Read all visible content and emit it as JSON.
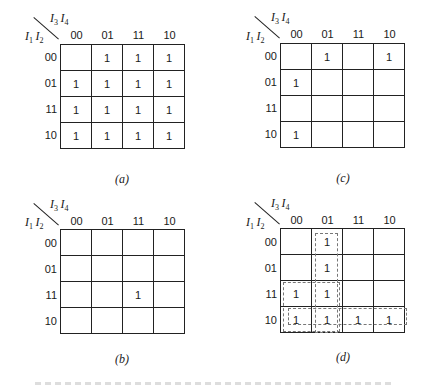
{
  "figure": {
    "row_var_label": [
      "I",
      "1",
      "I",
      "2"
    ],
    "col_var_label": [
      "I",
      "3",
      "I",
      "4"
    ],
    "col_headers": [
      "00",
      "01",
      "11",
      "10"
    ],
    "row_headers": [
      "00",
      "01",
      "11",
      "10"
    ],
    "maps": [
      {
        "id": "a",
        "caption": "(a)",
        "cells": [
          [
            "",
            "1",
            "1",
            "1"
          ],
          [
            "1",
            "1",
            "1",
            "1"
          ],
          [
            "1",
            "1",
            "1",
            "1"
          ],
          [
            "1",
            "1",
            "1",
            "1"
          ]
        ]
      },
      {
        "id": "c",
        "caption": "(c)",
        "cells": [
          [
            "",
            "1",
            "",
            "1"
          ],
          [
            "1",
            "",
            "",
            ""
          ],
          [
            "",
            "",
            "",
            ""
          ],
          [
            "1",
            "",
            "",
            ""
          ]
        ]
      },
      {
        "id": "b",
        "caption": "(b)",
        "cells": [
          [
            "",
            "",
            "",
            ""
          ],
          [
            "",
            "",
            "",
            ""
          ],
          [
            "",
            "",
            "1",
            ""
          ],
          [
            "",
            "",
            "",
            ""
          ]
        ]
      },
      {
        "id": "d",
        "caption": "(d)",
        "cells": [
          [
            "",
            "1",
            "",
            ""
          ],
          [
            "",
            "1",
            "",
            ""
          ],
          [
            "1",
            "1",
            "",
            ""
          ],
          [
            "1",
            "1",
            "1",
            "1"
          ]
        ],
        "groupings": [
          {
            "name": "column-01",
            "rows": [
              0,
              3
            ],
            "cols": [
              1,
              1
            ]
          },
          {
            "name": "block-rows-11-10-cols-00-01",
            "rows": [
              2,
              3
            ],
            "cols": [
              0,
              1
            ]
          },
          {
            "name": "row-10",
            "rows": [
              3,
              3
            ],
            "cols": [
              0,
              3
            ]
          }
        ]
      }
    ]
  }
}
